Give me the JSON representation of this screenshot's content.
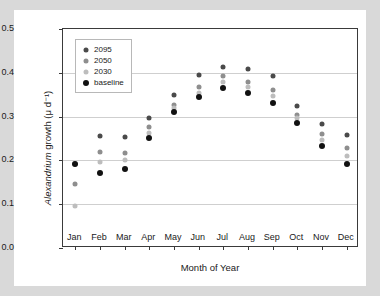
{
  "chart_data": {
    "type": "scatter",
    "title": "",
    "xlabel": "Month of Year",
    "ylabel": "Alexandrium growth (μ d⁻¹)",
    "ylabel_italic_part": "Alexandrium",
    "ylabel_plain_part": " growth (μ d⁻¹)",
    "categories": [
      "Jan",
      "Feb",
      "Mar",
      "Apr",
      "May",
      "Jun",
      "Jul",
      "Aug",
      "Sep",
      "Oct",
      "Nov",
      "Dec"
    ],
    "ylim": [
      0.0,
      0.5
    ],
    "yticks": [
      "0.0",
      "0.1",
      "0.2",
      "0.3",
      "0.4",
      "0.5"
    ],
    "ytick_values": [
      0.0,
      0.1,
      0.2,
      0.3,
      0.4,
      0.5
    ],
    "grid": "horizontal",
    "legend_position": "top-left",
    "series": [
      {
        "name": "2095",
        "color": "#4a4a4a",
        "marker_size": 5,
        "values": [
          0.192,
          0.255,
          0.254,
          0.296,
          0.35,
          0.396,
          0.414,
          0.408,
          0.392,
          0.325,
          0.284,
          0.258
        ]
      },
      {
        "name": "2050",
        "color": "#8e8e8e",
        "marker_size": 5,
        "values": [
          0.145,
          0.219,
          0.217,
          0.276,
          0.327,
          0.367,
          0.392,
          0.379,
          0.36,
          0.304,
          0.26,
          0.228
        ]
      },
      {
        "name": "2030",
        "color": "#bdbdbd",
        "marker_size": 5,
        "values": [
          0.097,
          0.197,
          0.2,
          0.262,
          0.32,
          0.355,
          0.379,
          0.367,
          0.348,
          0.296,
          0.247,
          0.211
        ]
      },
      {
        "name": "baseline",
        "color": "#111111",
        "marker_size": 6,
        "values": [
          0.192,
          0.171,
          0.18,
          0.252,
          0.311,
          0.345,
          0.365,
          0.353,
          0.332,
          0.286,
          0.232,
          0.192
        ]
      }
    ]
  },
  "legend": {
    "entries": [
      "2095",
      "2050",
      "2030",
      "baseline"
    ]
  }
}
